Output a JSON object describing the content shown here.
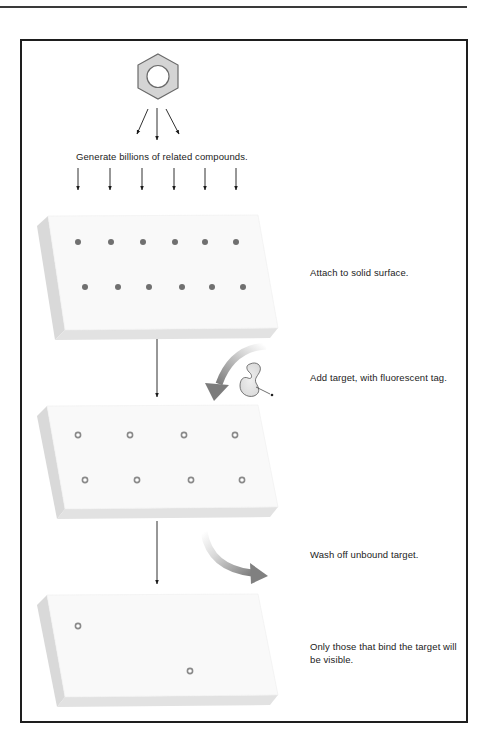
{
  "figure": {
    "molecule_icon": "benzene-hexagon",
    "steps": [
      {
        "id": "generate",
        "label": "Generate billions of related compounds."
      },
      {
        "id": "attach",
        "label": "Attach to solid surface."
      },
      {
        "id": "add_target",
        "label": "Add target, with fluorescent tag."
      },
      {
        "id": "wash",
        "label": "Wash off unbound target."
      },
      {
        "id": "visible",
        "label": "Only those that bind the target will be visible."
      }
    ],
    "slabs": [
      {
        "id": "slab-compounds",
        "spots": 12,
        "spot_style": "filled-dot"
      },
      {
        "id": "slab-with-target",
        "spots": 8,
        "spot_style": "ring"
      },
      {
        "id": "slab-bound-only",
        "spots": 2,
        "spot_style": "ring"
      }
    ],
    "colors": {
      "frame": "#1e1e1e",
      "slab_top": "#f9f9f9",
      "slab_side": "#dcdcdc",
      "spot_filled": "#6f6f6f",
      "spot_ring": "#8a8a8a",
      "curved_arrow": "#7a7a7a",
      "protein_fill": "#e4e4e4"
    }
  }
}
